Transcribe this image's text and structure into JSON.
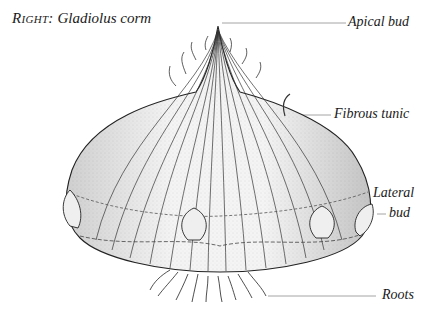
{
  "caption": {
    "prefix": "Right:",
    "title": "Gladiolus corm"
  },
  "labels": {
    "apical_bud": "Apical bud",
    "fibrous_tunic": "Fibrous tunic",
    "lateral": "Lateral",
    "bud": "bud",
    "roots": "Roots"
  },
  "colors": {
    "ink": "#1a1a1a",
    "leader": "#9a9a9a",
    "background": "#ffffff"
  }
}
